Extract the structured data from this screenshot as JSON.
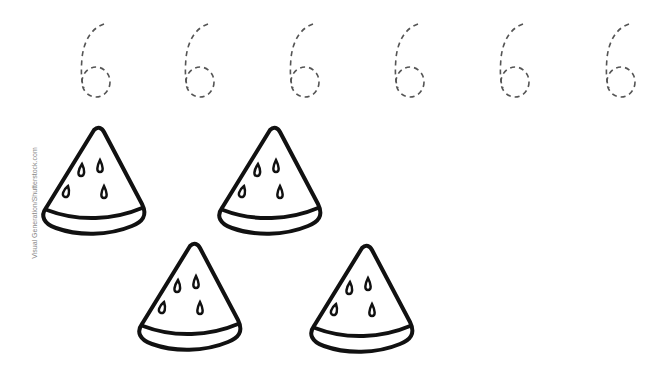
{
  "worksheet": {
    "tracing_digit": "6",
    "tracing_count": 6,
    "object": "watermelon-slice",
    "object_count": 4,
    "colors": {
      "trace": "#555555",
      "outline": "#111111",
      "background": "#ffffff"
    }
  },
  "watermark": {
    "text": "Visual Generation/Shutterstock.com"
  }
}
